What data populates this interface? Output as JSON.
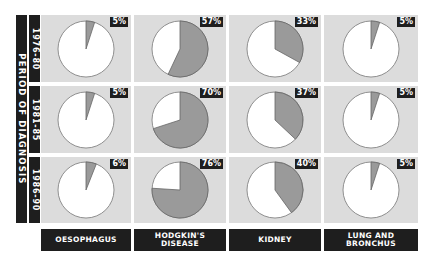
{
  "chart_data": {
    "type": "pie",
    "title": "",
    "row_axis_label": "PERIOD OF DIAGNOSIS",
    "rows": [
      "1976-80",
      "1981-85",
      "1986-90"
    ],
    "columns": [
      "OESOPHAGUS",
      "HODGKIN'S DISEASE",
      "KIDNEY",
      "LUNG AND BRONCHUS"
    ],
    "values": [
      [
        5,
        57,
        33,
        5
      ],
      [
        5,
        70,
        37,
        5
      ],
      [
        6,
        76,
        40,
        5
      ]
    ],
    "labels": [
      [
        "5%",
        "57%",
        "33%",
        "5%"
      ],
      [
        "5%",
        "70%",
        "37%",
        "5%"
      ],
      [
        "6%",
        "76%",
        "40%",
        "5%"
      ]
    ],
    "colors": {
      "slice": "#9a9a9a",
      "remainder": "#ffffff",
      "cell_bg": "#dcdcdc",
      "bar": "#1e1e1e"
    }
  },
  "axis": {
    "period_label": "PERIOD OF DIAGNOSIS",
    "years": [
      "1976-80",
      "1981-85",
      "1986-90"
    ]
  },
  "columns": {
    "c0": "OESOPHAGUS",
    "c1a": "HODGKIN'S",
    "c1b": "DISEASE",
    "c2": "KIDNEY",
    "c3a": "LUNG AND",
    "c3b": "BRONCHUS"
  },
  "cells": [
    [
      {
        "pct": "5%",
        "v": 5
      },
      {
        "pct": "57%",
        "v": 57
      },
      {
        "pct": "33%",
        "v": 33
      },
      {
        "pct": "5%",
        "v": 5
      }
    ],
    [
      {
        "pct": "5%",
        "v": 5
      },
      {
        "pct": "70%",
        "v": 70
      },
      {
        "pct": "37%",
        "v": 37
      },
      {
        "pct": "5%",
        "v": 5
      }
    ],
    [
      {
        "pct": "6%",
        "v": 6
      },
      {
        "pct": "76%",
        "v": 76
      },
      {
        "pct": "40%",
        "v": 40
      },
      {
        "pct": "5%",
        "v": 5
      }
    ]
  ]
}
